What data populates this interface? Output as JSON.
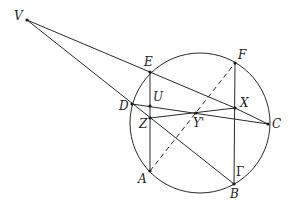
{
  "diagram": {
    "type": "geometry",
    "circle": {
      "name": "Γ",
      "label": "Γ",
      "cx": 200,
      "cy": 123,
      "r": 70,
      "label_pos": [
        236,
        176
      ]
    },
    "points": [
      {
        "id": "V",
        "label": "V",
        "x": 27,
        "y": 20,
        "lx": 14,
        "ly": 20
      },
      {
        "id": "E",
        "label": "E",
        "x": 150,
        "y": 72,
        "lx": 144,
        "ly": 66
      },
      {
        "id": "F",
        "label": "F",
        "x": 235,
        "y": 63,
        "lx": 238,
        "ly": 59
      },
      {
        "id": "D",
        "label": "D",
        "x": 132,
        "y": 104,
        "lx": 119,
        "ly": 110
      },
      {
        "id": "U",
        "label": "U",
        "x": 150,
        "y": 106,
        "lx": 153,
        "ly": 101
      },
      {
        "id": "X",
        "label": "X",
        "x": 235,
        "y": 108,
        "lx": 240,
        "ly": 107
      },
      {
        "id": "Z",
        "label": "Z",
        "x": 150,
        "y": 118,
        "lx": 139,
        "ly": 128
      },
      {
        "id": "Y'",
        "label": "Y'",
        "x": 196,
        "y": 113,
        "lx": 193,
        "ly": 127
      },
      {
        "id": "C",
        "label": "C",
        "x": 268,
        "y": 124,
        "lx": 272,
        "ly": 128
      },
      {
        "id": "A",
        "label": "A",
        "x": 150,
        "y": 171,
        "lx": 138,
        "ly": 183
      },
      {
        "id": "B",
        "label": "B",
        "x": 234,
        "y": 184,
        "lx": 230,
        "ly": 198
      }
    ],
    "segments": [
      {
        "from": "V",
        "to": "X",
        "style": "solid"
      },
      {
        "from": "V",
        "to": "B",
        "style": "solid"
      },
      {
        "from": "E",
        "to": "A",
        "style": "solid"
      },
      {
        "from": "F",
        "to": "B",
        "style": "solid"
      },
      {
        "from": "D",
        "to": "C",
        "style": "solid"
      },
      {
        "from": "Z",
        "to": "X",
        "style": "solid"
      },
      {
        "from": "X",
        "to": "C",
        "style": "solid"
      },
      {
        "from": "A",
        "to": "F",
        "style": "dashed"
      }
    ]
  }
}
